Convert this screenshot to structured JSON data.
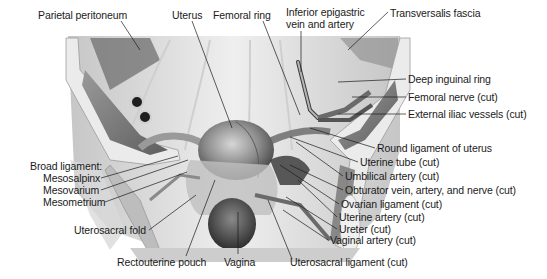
{
  "figure": {
    "colors": {
      "background": "#ffffff",
      "ink": "#1a1a1a",
      "muscle": "#7a7a7a",
      "bone": "#e4e4e4",
      "organ": "#8c8c8c"
    }
  },
  "labels": {
    "top": [
      {
        "id": "parietal-peritoneum",
        "text": "Parietal peritoneum",
        "x": 38,
        "y": 9
      },
      {
        "id": "uterus",
        "text": "Uterus",
        "x": 172,
        "y": 9
      },
      {
        "id": "femoral-ring",
        "text": "Femoral ring",
        "x": 213,
        "y": 9
      },
      {
        "id": "inferior-epigastric",
        "text": "Inferior epigastric",
        "x": 286,
        "y": 6
      },
      {
        "id": "inferior-epigastric-2",
        "text": "vein and artery",
        "x": 286,
        "y": 18
      },
      {
        "id": "transversalis-fascia",
        "text": "Transversalis fascia",
        "x": 390,
        "y": 7
      }
    ],
    "right": [
      {
        "id": "deep-inguinal-ring",
        "text": "Deep inguinal ring",
        "x": 408,
        "y": 73
      },
      {
        "id": "femoral-nerve",
        "text": "Femoral nerve (cut)",
        "x": 408,
        "y": 91
      },
      {
        "id": "external-iliac-vessels",
        "text": "External iliac vessels (cut)",
        "x": 408,
        "y": 108
      },
      {
        "id": "round-ligament",
        "text": "Round ligament of uterus",
        "x": 377,
        "y": 142
      },
      {
        "id": "uterine-tube",
        "text": "Uterine tube (cut)",
        "x": 360,
        "y": 156
      },
      {
        "id": "umbilical-artery",
        "text": "Umbilical artery (cut)",
        "x": 345,
        "y": 170
      },
      {
        "id": "obturator",
        "text": "Obturator vein, artery, and nerve (cut)",
        "x": 345,
        "y": 184
      },
      {
        "id": "ovarian-ligament",
        "text": "Ovarian ligament (cut)",
        "x": 341,
        "y": 198
      },
      {
        "id": "uterine-artery",
        "text": "Uterine artery (cut)",
        "x": 339,
        "y": 211
      },
      {
        "id": "ureter",
        "text": "Ureter (cut)",
        "x": 339,
        "y": 223
      },
      {
        "id": "vaginal-artery",
        "text": "Vaginal artery (cut)",
        "x": 330,
        "y": 234
      }
    ],
    "left": [
      {
        "id": "broad-ligament",
        "text": "Broad ligament:",
        "x": 30,
        "y": 160
      },
      {
        "id": "mesosalpinx",
        "text": "Mesosalpinx",
        "x": 43,
        "y": 172
      },
      {
        "id": "mesovarium",
        "text": "Mesovarium",
        "x": 43,
        "y": 184
      },
      {
        "id": "mesometrium",
        "text": "Mesometrium",
        "x": 43,
        "y": 196
      },
      {
        "id": "uterosacral-fold",
        "text": "Uterosacral fold",
        "x": 74,
        "y": 224
      }
    ],
    "bottom": [
      {
        "id": "rectouterine-pouch",
        "text": "Rectouterine pouch",
        "x": 117,
        "y": 256
      },
      {
        "id": "vagina",
        "text": "Vagina",
        "x": 224,
        "y": 256
      },
      {
        "id": "uterosacral-ligament",
        "text": "Uterosacral ligament (cut)",
        "x": 290,
        "y": 256
      }
    ]
  }
}
